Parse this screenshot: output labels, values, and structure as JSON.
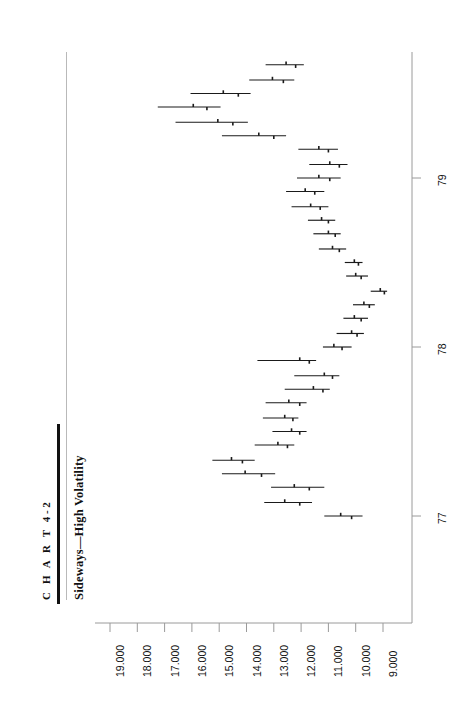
{
  "header": {
    "chart_label": "C H A R T  4-2",
    "subtitle": "Sideways—High Volatility"
  },
  "axes": {
    "value_axis_labels": [
      "19.000",
      "18.000",
      "17.000",
      "16.000",
      "15.000",
      "14.000",
      "13.000",
      "12.000",
      "11.000",
      "10.000",
      "9.000"
    ],
    "time_axis_labels": [
      "77",
      "78",
      "79"
    ]
  },
  "colors": {
    "bar": "#1a1a1a",
    "axis": "#9a9a9a",
    "rule": "#111111",
    "background": "#ffffff"
  },
  "chart_data": {
    "type": "bar",
    "orientation": "rotated-90-ccw",
    "title": "C H A R T  4-2",
    "subtitle": "Sideways—High Volatility",
    "xlabel": "",
    "ylabel": "",
    "grid": false,
    "legend": null,
    "xlim": [
      76.55,
      79.75
    ],
    "ylim": [
      8.6,
      19.6
    ],
    "value_axis_ticks": [
      19.0,
      18.0,
      17.0,
      16.0,
      15.0,
      14.0,
      13.0,
      12.0,
      11.0,
      10.0,
      9.0
    ],
    "time_axis_ticks": [
      77,
      78,
      79
    ],
    "categories": [
      "77.00",
      "77.08",
      "77.17",
      "77.25",
      "77.33",
      "77.42",
      "77.50",
      "77.58",
      "77.67",
      "77.75",
      "77.83",
      "77.92",
      "78.00",
      "78.08",
      "78.17",
      "78.25",
      "78.33",
      "78.42",
      "78.50",
      "78.58",
      "78.67",
      "78.75",
      "78.83",
      "78.92",
      "79.00",
      "79.08",
      "79.17",
      "79.25",
      "79.33",
      "79.42",
      "79.50",
      "79.58",
      "79.67"
    ],
    "series": [
      {
        "name": "High",
        "values": [
          11.15,
          13.35,
          13.1,
          14.9,
          15.25,
          13.7,
          13.05,
          13.4,
          13.3,
          12.6,
          12.25,
          13.6,
          11.2,
          10.7,
          10.45,
          10.1,
          9.45,
          10.35,
          10.4,
          11.35,
          11.55,
          11.75,
          12.35,
          12.55,
          12.15,
          11.7,
          12.1,
          14.9,
          16.6,
          17.25,
          16.05,
          13.9,
          13.3
        ]
      },
      {
        "name": "Low",
        "values": [
          9.75,
          11.6,
          11.15,
          12.95,
          13.7,
          12.25,
          11.8,
          12.1,
          11.8,
          10.95,
          10.6,
          11.45,
          10.15,
          9.7,
          9.55,
          9.3,
          8.85,
          9.55,
          9.75,
          10.35,
          10.55,
          10.75,
          11.0,
          11.15,
          10.55,
          10.3,
          10.65,
          12.55,
          13.95,
          14.95,
          13.85,
          12.25,
          11.9
        ]
      },
      {
        "name": "Open",
        "values": [
          10.55,
          12.6,
          12.25,
          14.05,
          14.55,
          12.85,
          12.35,
          12.6,
          12.45,
          11.55,
          11.15,
          12.05,
          10.8,
          10.15,
          10.05,
          9.7,
          9.1,
          10.0,
          10.05,
          10.85,
          11.0,
          11.25,
          11.65,
          11.85,
          11.35,
          10.95,
          11.35,
          13.55,
          15.05,
          15.95,
          14.85,
          13.05,
          12.55
        ]
      },
      {
        "name": "Close",
        "values": [
          10.15,
          12.05,
          11.7,
          13.45,
          14.15,
          12.5,
          12.05,
          12.3,
          12.05,
          11.2,
          10.85,
          11.7,
          10.5,
          9.95,
          9.8,
          9.5,
          8.95,
          9.8,
          9.9,
          10.6,
          10.75,
          11.0,
          11.3,
          11.5,
          10.95,
          10.6,
          11.0,
          13.0,
          14.5,
          15.45,
          14.3,
          12.65,
          12.2
        ]
      }
    ]
  }
}
